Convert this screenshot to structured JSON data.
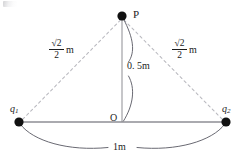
{
  "figure": {
    "type": "physics-diagram",
    "background_color": "#ffffff",
    "ink_color": "#1d1d1d",
    "dashed_line_color": "#b9b9bf",
    "solid_line_color": "#8e8e94",
    "arc_color": "#5a5a5f",
    "node_color": "#111111"
  },
  "points": {
    "apex_label": "P",
    "origin_label": "O",
    "charge_left_label": "q",
    "charge_left_subscript": "1",
    "charge_right_label": "q",
    "charge_right_subscript": "2"
  },
  "measurements": {
    "left_side": {
      "numerator": "√2",
      "denominator": "2",
      "unit": "m"
    },
    "right_side": {
      "numerator": "√2",
      "denominator": "2",
      "unit": "m"
    },
    "height": "0. 5m",
    "baseline": "1m"
  },
  "geometry": {
    "apex": {
      "x": 122,
      "y": 16
    },
    "origin": {
      "x": 122,
      "y": 122
    },
    "charge_left": {
      "x": 19,
      "y": 122
    },
    "charge_right": {
      "x": 226,
      "y": 122
    },
    "node_radius": 4.6
  }
}
